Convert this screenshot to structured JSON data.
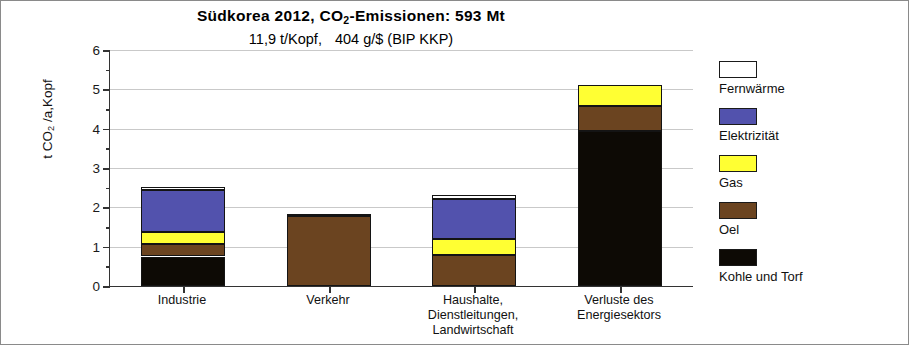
{
  "figure": {
    "title_main_pre": "Südkorea 2012,  CO",
    "title_main_sub": "2",
    "title_main_post": "-Emissionen:  593 Mt",
    "title_sub_a": "11,9 t/Kopf,",
    "title_sub_b": "404 g/$  (BIP KKP)",
    "y_axis_title_pre": "t CO",
    "y_axis_title_sub": "2",
    "y_axis_title_post": " /a,Kopf"
  },
  "chart_data": {
    "type": "bar",
    "subtype": "stacked",
    "title": "Südkorea 2012, CO2-Emissionen: 593 Mt",
    "subtitle": "11,9 t/Kopf, 404 g/$ (BIP KKP)",
    "xlabel": "",
    "ylabel": "t CO2 /a,Kopf",
    "ylim": [
      0,
      6
    ],
    "ytick_labels": [
      "0",
      "1",
      "2",
      "3",
      "4",
      "5",
      "6"
    ],
    "ytick_values": [
      0,
      1,
      2,
      3,
      4,
      5,
      6
    ],
    "yminor_values": [
      0.5,
      1.5,
      2.5,
      3.5,
      4.5,
      5.5
    ],
    "grid": "horizontal",
    "legend_position": "right",
    "categories": [
      "Industrie",
      "Verkehr",
      "Haushalte, Dienstleitungen, Landwirtschaft",
      "Verluste des Energiesektors"
    ],
    "category_lines": [
      [
        "Industrie"
      ],
      [
        "Verkehr"
      ],
      [
        "Haushalte,",
        "Dienstleitungen,",
        "Landwirtschaft"
      ],
      [
        "Verluste des",
        "Energiesektors"
      ]
    ],
    "series": [
      {
        "name": "Kohle und Torf",
        "color": "#0d0a05",
        "values": [
          0.75,
          0.0,
          0.0,
          3.95
        ]
      },
      {
        "name": "Oel",
        "color": "#6b4420",
        "values": [
          0.32,
          1.77,
          0.8,
          0.63
        ]
      },
      {
        "name": "Gas",
        "color": "#ffff33",
        "values": [
          0.3,
          0.05,
          0.4,
          0.52
        ]
      },
      {
        "name": "Elektrizität",
        "color": "#5252ad",
        "values": [
          1.08,
          0.0,
          1.02,
          0.0
        ]
      },
      {
        "name": "Fernwärme",
        "color": "#ffffff",
        "values": [
          0.07,
          0.0,
          0.1,
          0.0
        ]
      }
    ],
    "totals": [
      2.52,
      1.82,
      2.32,
      5.1
    ]
  },
  "legend": {
    "items": [
      {
        "label": "Fernwärme",
        "color": "#ffffff"
      },
      {
        "label": "Elektrizität",
        "color": "#5252ad"
      },
      {
        "label": "Gas",
        "color": "#ffff33"
      },
      {
        "label": "Oel",
        "color": "#6b4420"
      },
      {
        "label": "Kohle und Torf",
        "color": "#0d0a05"
      }
    ]
  }
}
